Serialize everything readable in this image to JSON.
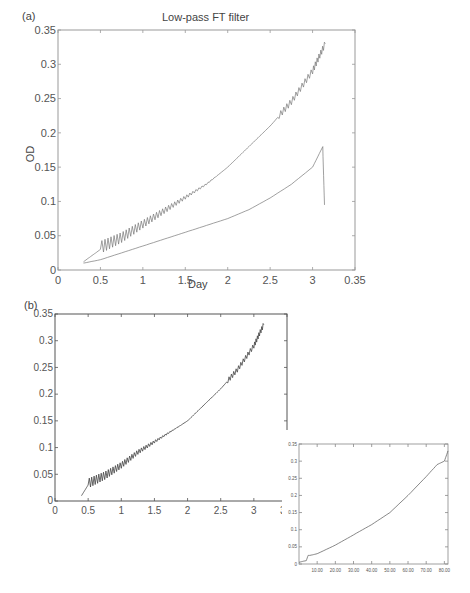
{
  "figure": {
    "panel_a": {
      "label": "(a)",
      "title": "Low-pass FT filter",
      "xlabel": "Day",
      "ylabel": "OD"
    },
    "panel_b": {
      "label": "(b)"
    },
    "inset": {
      "xlabel": "Varbes"
    }
  },
  "chart_data": [
    {
      "type": "line",
      "panel": "(a)",
      "title": "Low-pass FT filter",
      "xlabel": "Day",
      "ylabel": "OD",
      "xlim": [
        0,
        3.5
      ],
      "ylim": [
        0,
        0.35
      ],
      "xticks": [
        "0",
        "0.5",
        "1",
        "1.5",
        "2",
        "2.5",
        "3",
        "0.35"
      ],
      "yticks": [
        "0",
        "0.05",
        "0.1",
        "0.15",
        "0.2",
        "0.25",
        "0.3",
        "0.35"
      ],
      "grid": false,
      "series": [
        {
          "name": "raw OD (oscillating)",
          "x": [
            0.3,
            0.5,
            0.75,
            1.0,
            1.25,
            1.5,
            1.75,
            2.0,
            2.25,
            2.5,
            2.75,
            3.0,
            3.15
          ],
          "y": [
            0.012,
            0.03,
            0.045,
            0.065,
            0.085,
            0.105,
            0.125,
            0.15,
            0.18,
            0.21,
            0.245,
            0.29,
            0.33
          ]
        },
        {
          "name": "filtered OD",
          "x": [
            0.3,
            0.5,
            0.75,
            1.0,
            1.25,
            1.5,
            1.75,
            2.0,
            2.25,
            2.5,
            2.75,
            3.0,
            3.12,
            3.14
          ],
          "y": [
            0.01,
            0.015,
            0.025,
            0.035,
            0.045,
            0.055,
            0.065,
            0.075,
            0.088,
            0.105,
            0.125,
            0.15,
            0.18,
            0.095
          ]
        }
      ]
    },
    {
      "type": "line",
      "panel": "(b)",
      "xlim": [
        0,
        3.5
      ],
      "ylim": [
        0,
        0.35
      ],
      "xticks": [
        "0",
        "0.5",
        "1",
        "1.5",
        "2",
        "2.5",
        "3",
        "3.5"
      ],
      "yticks": [
        "0",
        "0.05",
        "0.1",
        "0.15",
        "0.2",
        "0.25",
        "0.3",
        "0.35"
      ],
      "series": [
        {
          "name": "OD",
          "x": [
            0.4,
            0.5,
            0.75,
            1.0,
            1.25,
            1.5,
            1.75,
            2.0,
            2.25,
            2.5,
            2.75,
            3.0,
            3.15
          ],
          "y": [
            0.01,
            0.03,
            0.045,
            0.065,
            0.09,
            0.11,
            0.13,
            0.15,
            0.18,
            0.21,
            0.245,
            0.29,
            0.33
          ]
        }
      ]
    },
    {
      "type": "line",
      "panel": "inset",
      "xlabel": "Varbes",
      "xlim": [
        0,
        82
      ],
      "ylim": [
        0,
        0.35
      ],
      "xticks": [
        "10.00",
        "20.00",
        "30.00",
        "40.00",
        "50.00",
        "60.00",
        "70.00",
        "80.00"
      ],
      "yticks": [
        "0",
        "0.05",
        "0.1",
        "0.15",
        "0.2",
        "0.25",
        "0.3",
        "0.35"
      ],
      "series": [
        {
          "name": "OD",
          "x": [
            0,
            4,
            5,
            6,
            10,
            20,
            30,
            40,
            50,
            60,
            70,
            76,
            80,
            82
          ],
          "y": [
            0.005,
            0.01,
            0.025,
            0.025,
            0.03,
            0.055,
            0.085,
            0.115,
            0.15,
            0.2,
            0.255,
            0.29,
            0.3,
            0.33
          ]
        }
      ]
    }
  ]
}
